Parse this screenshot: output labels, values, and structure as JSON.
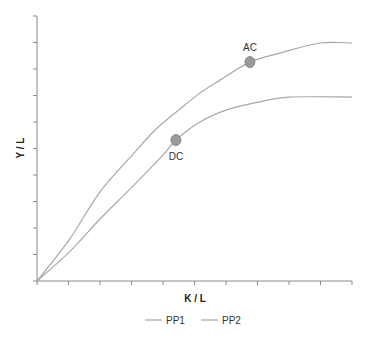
{
  "chart_data": {
    "type": "line",
    "title": "",
    "xlabel": "K / L",
    "ylabel": "Y / L",
    "xlim": [
      0,
      10
    ],
    "ylim": [
      0,
      10
    ],
    "x_ticks": 10,
    "y_ticks": 10,
    "tick_labels_shown": false,
    "grid": false,
    "legend_position": "bottom",
    "series": [
      {
        "name": "PP1",
        "color": "#a8a8a8",
        "points": [
          [
            0,
            0
          ],
          [
            1.02,
            1.55
          ],
          [
            2.0,
            3.36
          ],
          [
            3.02,
            4.75
          ],
          [
            3.75,
            5.7
          ],
          [
            4.54,
            6.49
          ],
          [
            5.17,
            7.09
          ],
          [
            5.81,
            7.58
          ],
          [
            6.76,
            8.26
          ],
          [
            7.71,
            8.6
          ],
          [
            8.98,
            8.98
          ],
          [
            10,
            8.98
          ]
        ]
      },
      {
        "name": "PP2",
        "color": "#a8a8a8",
        "points": [
          [
            0,
            0
          ],
          [
            1.02,
            1.09
          ],
          [
            2.0,
            2.34
          ],
          [
            3.02,
            3.55
          ],
          [
            4.0,
            4.75
          ],
          [
            4.41,
            5.32
          ],
          [
            5.17,
            6.0
          ],
          [
            6.0,
            6.45
          ],
          [
            7.02,
            6.75
          ],
          [
            8.0,
            6.94
          ],
          [
            10,
            6.94
          ]
        ]
      }
    ],
    "annotations": [
      {
        "label": "AC",
        "x": 6.76,
        "y": 8.26,
        "series": "PP1"
      },
      {
        "label": "DC",
        "x": 4.41,
        "y": 5.32,
        "series": "PP2"
      }
    ]
  },
  "colors": {
    "axis": "#8a8a8a",
    "marker_fill": "#9a9a9a",
    "marker_stroke": "#7a7a7a"
  }
}
